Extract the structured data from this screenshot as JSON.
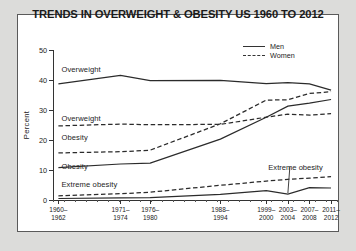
{
  "frame": {
    "border_color": "#5a5a5a",
    "background": "#ffffff",
    "page_background": "#dcdcda"
  },
  "chart_data": {
    "type": "line",
    "title": "TRENDS IN OVERWEIGHT & OBESITY US 1960 TO 2012",
    "xlabel": "",
    "ylabel": "Percent",
    "ylim": [
      0,
      50
    ],
    "yticks": [
      0,
      10,
      20,
      30,
      40,
      50
    ],
    "grid": false,
    "legend_position": "top-right",
    "categories": [
      "1960–\n1962",
      "1971–\n1974",
      "1976–\n1980",
      "1988–\n1994",
      "1999–\n2000",
      "2003–\n2004",
      "2007–\n2008",
      "2011–\n2012"
    ],
    "category_lines": [
      [
        "1960–",
        "1962"
      ],
      [
        "1971–",
        "1974"
      ],
      [
        "1976–",
        "1980"
      ],
      [
        "1988–",
        "1994"
      ],
      [
        "1999–",
        "2000"
      ],
      [
        "2003–",
        "2004"
      ],
      [
        "2007–",
        "2008"
      ],
      [
        "2011–",
        "2012"
      ]
    ],
    "legend": [
      {
        "name": "Men",
        "style": "solid"
      },
      {
        "name": "Women",
        "style": "dashed"
      }
    ],
    "series": [
      {
        "name": "Overweight",
        "sex": "Men",
        "style": "solid",
        "values": [
          38.7,
          41.5,
          39.8,
          39.9,
          38.8,
          39.1,
          38.7,
          36.6
        ]
      },
      {
        "name": "Overweight",
        "sex": "Women",
        "style": "dashed",
        "values": [
          24.7,
          25.3,
          25.1,
          25.2,
          27.6,
          28.6,
          28.3,
          28.8
        ]
      },
      {
        "name": "Obesity",
        "sex": "Women",
        "style": "dashed",
        "values": [
          15.7,
          16.1,
          16.6,
          25.4,
          33.3,
          33.4,
          35.5,
          36.1
        ]
      },
      {
        "name": "Obesity",
        "sex": "Men",
        "style": "solid",
        "values": [
          10.8,
          12.0,
          12.3,
          20.3,
          27.6,
          31.3,
          32.3,
          33.5
        ]
      },
      {
        "name": "Extreme obesity",
        "sex": "Women",
        "style": "dashed",
        "values": [
          1.4,
          2.1,
          2.6,
          4.9,
          6.3,
          6.9,
          7.3,
          7.8
        ]
      },
      {
        "name": "Extreme obesity",
        "sex": "Men",
        "style": "solid",
        "values": [
          0.5,
          0.7,
          0.8,
          1.9,
          3.1,
          2.0,
          4.1,
          4.0
        ]
      }
    ],
    "inline_labels": [
      {
        "text": "Overweight",
        "value": 43.5,
        "category_index": 0
      },
      {
        "text": "Overweight",
        "value": 27.0,
        "category_index": 0
      },
      {
        "text": "Obesity",
        "value": 20.6,
        "category_index": 0
      },
      {
        "text": "Obesity",
        "value": 11.0,
        "category_index": 0
      },
      {
        "text": "Extreme obesity",
        "value": 5.0,
        "category_index": 0
      }
    ],
    "annotations": [
      {
        "text": "Extreme obesity",
        "points_to": "Men extreme obesity dip at 2003–2004"
      }
    ]
  }
}
